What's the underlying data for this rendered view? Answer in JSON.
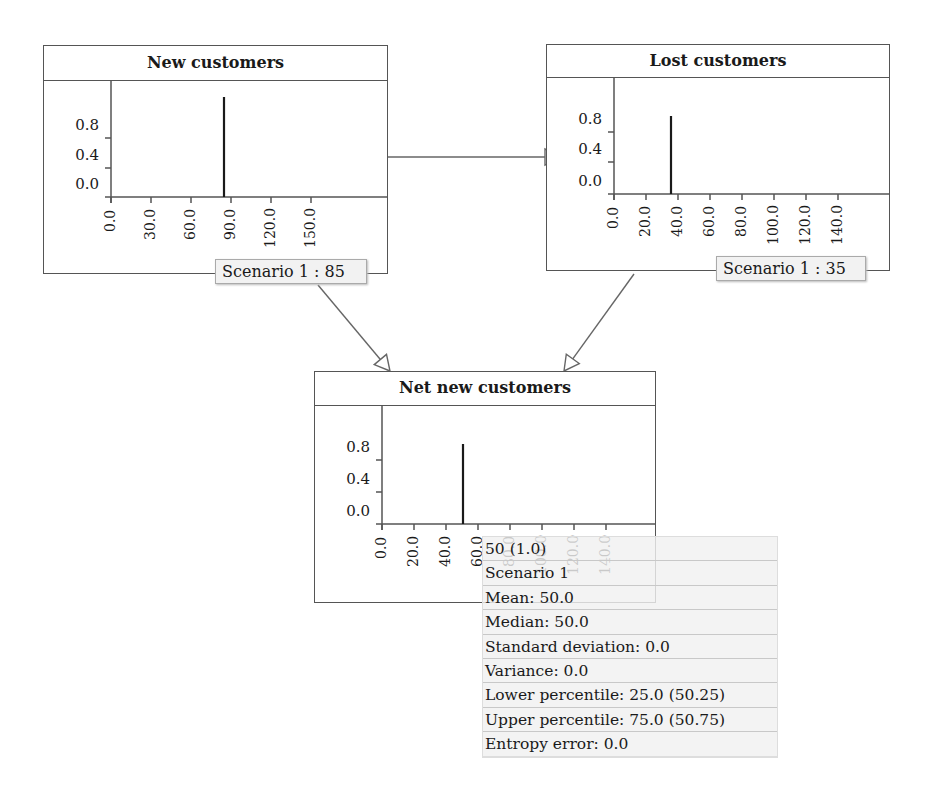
{
  "nodes": [
    {
      "id": "new",
      "title": "New customers",
      "box": {
        "x": 43,
        "y": 45,
        "w": 345,
        "h": 229
      },
      "header_h": 35,
      "axis": {
        "x0": 111,
        "y0": 197,
        "ytop": 80
      },
      "yticks": [
        {
          "label": "0.8",
          "y": 138
        },
        {
          "label": "0.4",
          "y": 168
        },
        {
          "label": "0.0",
          "y": 197
        }
      ],
      "xticks": {
        "labels": [
          "0.0",
          "30.0",
          "60.0",
          "90.0",
          "120.0",
          "150.0"
        ],
        "start": 111,
        "step": 40
      },
      "axis_right": 388,
      "spike": {
        "x": 224,
        "top": 97
      },
      "scenario_label": "Scenario 1 : 85",
      "label_box": {
        "x": 215,
        "y": 259,
        "w": 152
      }
    },
    {
      "id": "lost",
      "title": "Lost customers",
      "box": {
        "x": 546,
        "y": 44,
        "w": 344,
        "h": 227
      },
      "header_h": 33,
      "axis": {
        "x0": 614,
        "y0": 194,
        "ytop": 77
      },
      "yticks": [
        {
          "label": "0.8",
          "y": 132
        },
        {
          "label": "0.4",
          "y": 162
        },
        {
          "label": "0.0",
          "y": 194
        }
      ],
      "xticks": {
        "labels": [
          "0.0",
          "20.0",
          "40.0",
          "60.0",
          "80.0",
          "100.0",
          "120.0",
          "140.0"
        ],
        "start": 614,
        "step": 32
      },
      "axis_right": 890,
      "spike": {
        "x": 671,
        "top": 116
      },
      "scenario_label": "Scenario 1 : 35",
      "label_box": {
        "x": 716,
        "y": 256,
        "w": 150
      }
    },
    {
      "id": "net",
      "title": "Net new customers",
      "box": {
        "x": 314,
        "y": 371,
        "w": 342,
        "h": 232
      },
      "header_h": 34,
      "axis": {
        "x0": 382,
        "y0": 524,
        "ytop": 405
      },
      "yticks": [
        {
          "label": "0.8",
          "y": 460
        },
        {
          "label": "0.4",
          "y": 492
        },
        {
          "label": "0.0",
          "y": 524
        }
      ],
      "xticks": {
        "labels": [
          "0.0",
          "20.0",
          "40.0",
          "60.0",
          "80.0",
          "100.0",
          "120.0",
          "140.0"
        ],
        "start": 382,
        "step": 32
      },
      "axis_right": 656,
      "spike": {
        "x": 463,
        "top": 444
      },
      "scenario_label": "",
      "label_box": null
    }
  ],
  "edges": [
    {
      "from": "new",
      "to": "lost",
      "x1": 388,
      "y1": 157,
      "x2": 560,
      "y2": 157
    },
    {
      "from": "new",
      "to": "net",
      "x1": 318,
      "y1": 285,
      "x2": 390,
      "y2": 371
    },
    {
      "from": "lost",
      "to": "net",
      "x1": 634,
      "y1": 274,
      "x2": 564,
      "y2": 371
    }
  ],
  "tooltip": {
    "rows": [
      "50 (1.0)",
      "Scenario 1",
      "Mean: 50.0",
      "Median: 50.0",
      "Standard deviation: 0.0",
      "Variance: 0.0",
      "Lower percentile: 25.0 (50.25)",
      "Upper percentile: 75.0 (50.75)",
      "Entropy error: 0.0"
    ]
  },
  "colors": {
    "line": "#555555",
    "spike": "#1a1a1a",
    "tooltip_bg": "#f0f0f0"
  }
}
